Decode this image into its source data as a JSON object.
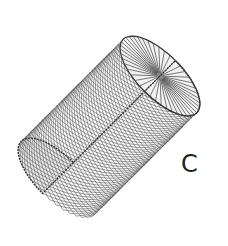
{
  "figure": {
    "panel_label": "C",
    "colors": {
      "background": "#ffffff",
      "fill": "#ececec",
      "strand": "#555555",
      "outline": "#333333"
    },
    "geometry": {
      "axis_start": [
        58,
        178
      ],
      "axis_end": [
        160,
        76
      ],
      "radius": 52,
      "cap_ratio": 0.42,
      "helix_count": 36,
      "spoke_count": 44
    }
  }
}
